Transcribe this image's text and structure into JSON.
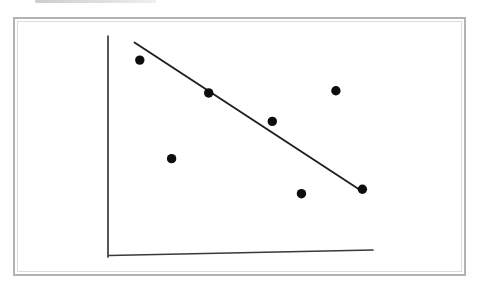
{
  "figure": {
    "background_color": "#ffffff",
    "frame": {
      "outer_border_color": "#b3b3b3",
      "inner_border_color": "#dbdbdb"
    },
    "scan_artifact": {
      "color_start": "#c3c3c3",
      "color_end": "#ececec"
    }
  },
  "chart_data": {
    "type": "scatter",
    "title": "",
    "xlabel": "",
    "ylabel": "",
    "xlim": [
      0,
      10
    ],
    "ylim": [
      0,
      10
    ],
    "grid": false,
    "legend": false,
    "tick_labels": false,
    "axes_visible": true,
    "points": [
      {
        "x": 1.2,
        "y": 8.9
      },
      {
        "x": 2.4,
        "y": 4.4
      },
      {
        "x": 3.8,
        "y": 7.4
      },
      {
        "x": 6.2,
        "y": 6.1
      },
      {
        "x": 7.3,
        "y": 2.8
      },
      {
        "x": 8.6,
        "y": 7.5
      },
      {
        "x": 9.6,
        "y": 3.0
      }
    ],
    "trend_line": {
      "x1": 1.0,
      "y1": 9.7,
      "x2": 9.6,
      "y2": 2.9
    },
    "point_color": "#0d0d0d",
    "point_radius": 4.7,
    "line_color": "#1f1f1f",
    "axis_color": "#3a3a3a"
  }
}
